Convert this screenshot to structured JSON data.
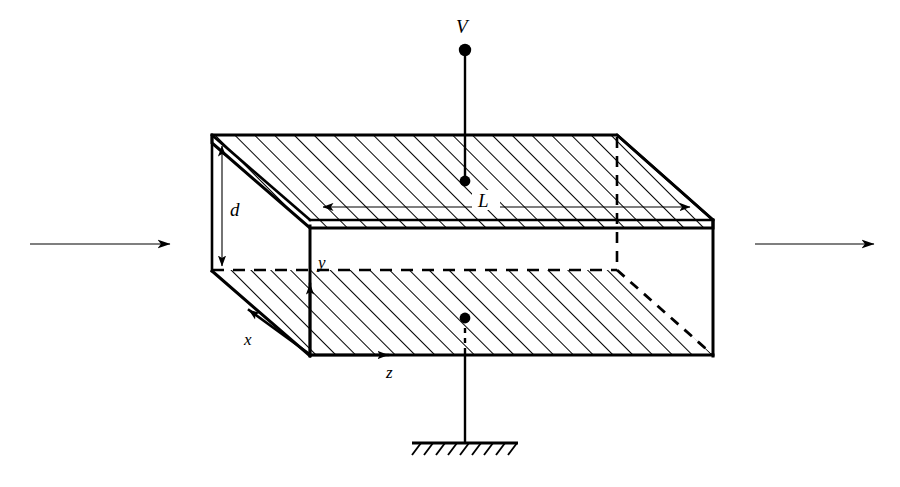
{
  "figure": {
    "background_color": "#ffffff",
    "line_color": "#000000",
    "width": 900,
    "height": 487
  },
  "labels": {
    "voltage_source": "V",
    "length": "L",
    "separation": "d",
    "axis_x": "x",
    "axis_y": "y",
    "axis_z": "z"
  },
  "geometry": {
    "top_slab": {
      "back_top_left": [
        212,
        135
      ],
      "back_top_right": [
        617,
        135
      ],
      "front_top_right": [
        713,
        220
      ],
      "front_top_left": [
        310,
        220
      ],
      "front_bottom_right": [
        713,
        228
      ],
      "front_bottom_left": [
        310,
        228
      ],
      "back_bottom_left": [
        212,
        143
      ]
    },
    "bottom_slab": {
      "back_top_left": [
        212,
        270
      ],
      "back_top_right": [
        617,
        270
      ],
      "front_top_right": [
        713,
        355
      ],
      "front_top_left": [
        310,
        355
      ]
    },
    "right_face": {
      "top": [
        713,
        220
      ],
      "bottom": [
        713,
        355
      ]
    },
    "front_left_edge": {
      "top": [
        310,
        220
      ],
      "bottom": [
        310,
        355
      ]
    },
    "hidden_back_vertical": {
      "top": [
        617,
        135
      ],
      "bottom": [
        617,
        270
      ]
    }
  },
  "hatching": {
    "angle_degrees": 45,
    "spacing_px": 14,
    "stroke_width": 2.0,
    "color": "#000000"
  },
  "dimensions": {
    "length_L": {
      "label": "L",
      "from": [
        315,
        207
      ],
      "to": [
        700,
        207
      ],
      "double_headed": true
    },
    "separation_d": {
      "label": "d",
      "from": [
        222,
        140
      ],
      "to": [
        222,
        272
      ],
      "double_headed": true
    }
  },
  "axes": {
    "x": {
      "label": "x",
      "origin": [
        310,
        355
      ],
      "tip": [
        240,
        303
      ],
      "direction": "down-left"
    },
    "y": {
      "label": "y",
      "origin": [
        310,
        355
      ],
      "tip": [
        310,
        272
      ],
      "direction": "up"
    },
    "z": {
      "label": "z",
      "origin": [
        310,
        355
      ],
      "tip": [
        398,
        355
      ],
      "direction": "right"
    }
  },
  "circuit": {
    "top_terminal": {
      "label": "V",
      "dot": [
        465,
        50
      ],
      "lead_from": [
        465,
        50
      ],
      "lead_to": [
        465,
        180
      ],
      "inner_dot": [
        465,
        180
      ]
    },
    "bottom_terminal": {
      "dot": [
        465,
        318
      ],
      "lead_from": [
        465,
        318
      ],
      "lead_to": [
        465,
        443
      ],
      "ground_bar_from": [
        412,
        443
      ],
      "ground_bar_to": [
        518,
        443
      ],
      "ground_tick_count": 10
    }
  },
  "flow_arrows": {
    "left": {
      "from": [
        30,
        244
      ],
      "to": [
        182,
        244
      ],
      "name": "incoming-flow-arrow"
    },
    "right": {
      "from": [
        755,
        244
      ],
      "to": [
        886,
        244
      ],
      "name": "outgoing-flow-arrow"
    }
  }
}
